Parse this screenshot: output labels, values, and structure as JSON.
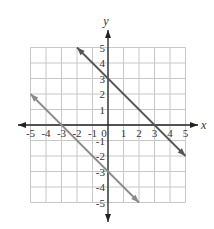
{
  "chart_data": {
    "type": "line",
    "title": "",
    "xlabel": "x",
    "ylabel": "y",
    "xlim": [
      -5,
      5
    ],
    "ylim": [
      -5,
      5
    ],
    "grid": true,
    "x_ticks": [
      "-5",
      "-4",
      "-3",
      "-2",
      "-1",
      "0",
      "1",
      "2",
      "3",
      "4",
      "5"
    ],
    "y_ticks": [
      "5",
      "4",
      "3",
      "2",
      "1",
      "-1",
      "-2",
      "-3",
      "-4",
      "-5"
    ],
    "series": [
      {
        "name": "y = -x + 3",
        "points": [
          [
            -2,
            5
          ],
          [
            5,
            -2
          ]
        ],
        "color": "#555555"
      },
      {
        "name": "y = -x - 3",
        "points": [
          [
            -5,
            2
          ],
          [
            2,
            -5
          ]
        ],
        "color": "#888888"
      }
    ]
  },
  "colors": {
    "grid": "#c8c8c8",
    "axis": "#222222",
    "line1": "#555555",
    "line2": "#8a8a8a"
  }
}
